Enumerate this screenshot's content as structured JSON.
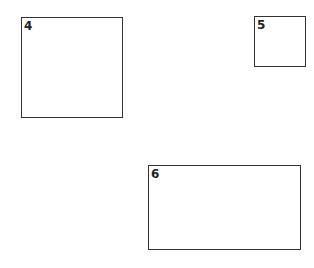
{
  "boxes": [
    {
      "label": "4",
      "x": 21,
      "y": 17,
      "w": 102,
      "h": 101
    },
    {
      "label": "5",
      "x": 254,
      "y": 16,
      "w": 52,
      "h": 51
    },
    {
      "label": "6",
      "x": 148,
      "y": 165,
      "w": 153,
      "h": 85
    }
  ],
  "colors": {
    "border": "#333333",
    "background": "#ffffff"
  }
}
